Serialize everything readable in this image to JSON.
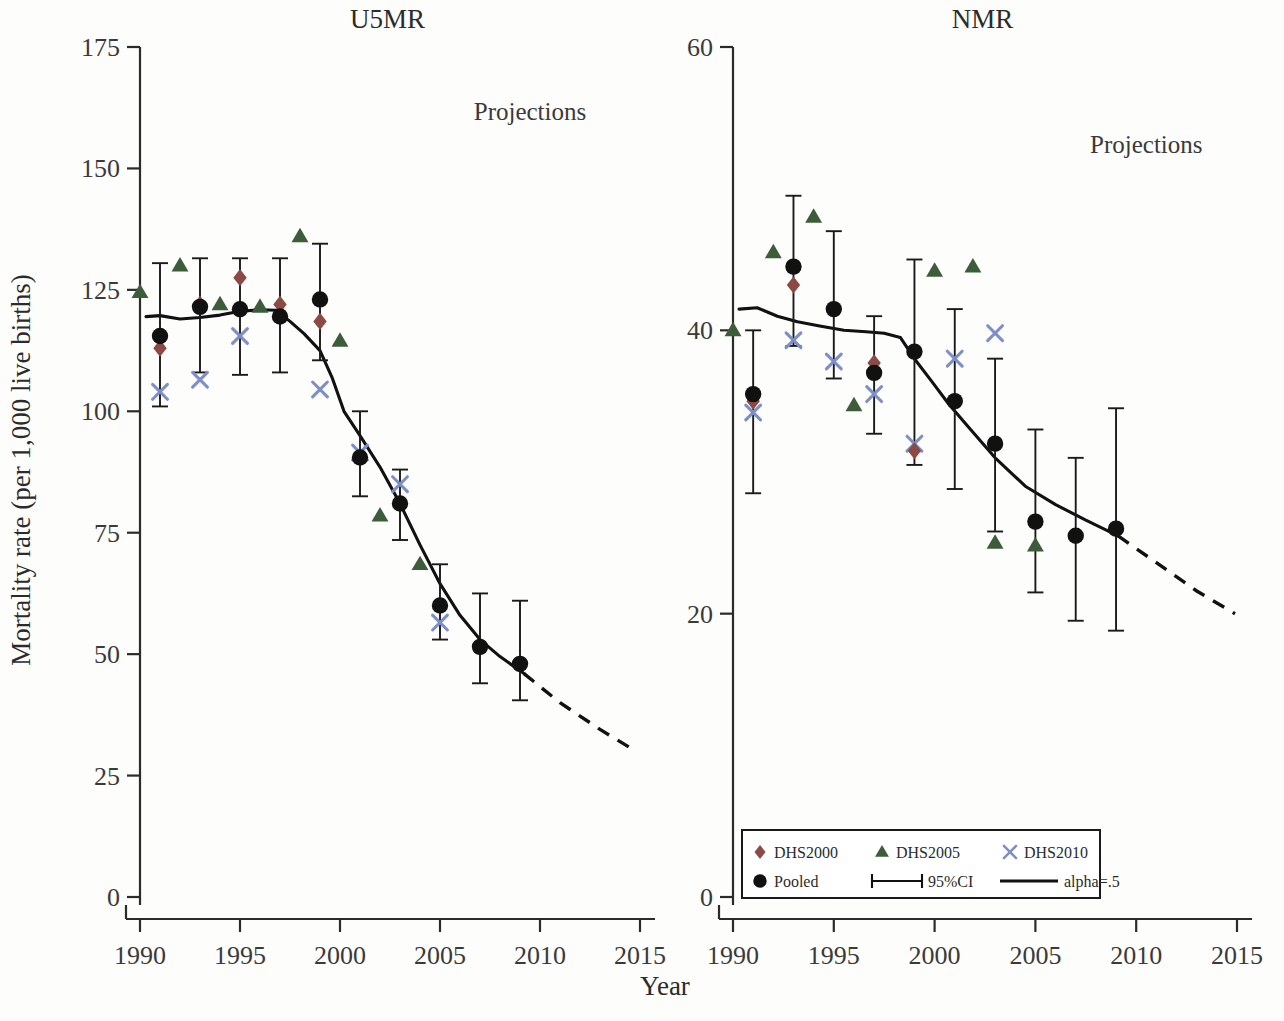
{
  "figure": {
    "x_axis_title": "Year",
    "y_axis_title": "Mortality rate (per 1,000 live births)",
    "projection_label": "Projections"
  },
  "legend": {
    "items": [
      {
        "key": "dhs2000",
        "label": "DHS2000",
        "marker": "diamond",
        "color": "#8c4a44"
      },
      {
        "key": "dhs2005",
        "label": "DHS2005",
        "marker": "triangle",
        "color": "#3c5c3a"
      },
      {
        "key": "dhs2010",
        "label": "DHS2010",
        "marker": "cross",
        "color": "#7d8fc6"
      },
      {
        "key": "pooled",
        "label": "Pooled",
        "marker": "circle",
        "color": "#111111"
      },
      {
        "key": "ci",
        "label": "95%CI",
        "marker": "errorbar",
        "color": "#111111"
      },
      {
        "key": "alpha",
        "label": "alpha=.5",
        "marker": "line",
        "color": "#111111"
      }
    ]
  },
  "chart_data": [
    {
      "type": "scatter",
      "panel": "left",
      "title": "U5MR",
      "xlabel": "Year",
      "ylabel": "Mortality rate (per 1,000 live births)",
      "xlim": [
        1989,
        2016
      ],
      "ylim": [
        0,
        175
      ],
      "xticks": [
        1990,
        1995,
        2000,
        2005,
        2010,
        2015
      ],
      "yticks": [
        0,
        25,
        50,
        75,
        100,
        125,
        150,
        175
      ],
      "grid": false,
      "legend_position": "none",
      "annotations": [
        {
          "text": "Projections",
          "x": 2009.5,
          "y": 160
        }
      ],
      "series": [
        {
          "name": "Pooled",
          "marker": "circle",
          "color": "#111111",
          "points": [
            {
              "x": 1991,
              "y": 115.5,
              "lo": 101.0,
              "hi": 130.5
            },
            {
              "x": 1993,
              "y": 121.5,
              "lo": 108.0,
              "hi": 131.5
            },
            {
              "x": 1995,
              "y": 121.0,
              "lo": 107.5,
              "hi": 131.5
            },
            {
              "x": 1997,
              "y": 119.5,
              "lo": 108.0,
              "hi": 131.5
            },
            {
              "x": 1999,
              "y": 123.0,
              "lo": 110.5,
              "hi": 134.5
            },
            {
              "x": 2001,
              "y": 90.5,
              "lo": 82.5,
              "hi": 100.0
            },
            {
              "x": 2003,
              "y": 81.0,
              "lo": 73.5,
              "hi": 88.0
            },
            {
              "x": 2005,
              "y": 60.0,
              "lo": 53.0,
              "hi": 68.5
            },
            {
              "x": 2007,
              "y": 51.5,
              "lo": 44.0,
              "hi": 62.5
            },
            {
              "x": 2009,
              "y": 48.0,
              "lo": 40.5,
              "hi": 61.0
            }
          ]
        },
        {
          "name": "DHS2000",
          "marker": "diamond",
          "color": "#8c4a44",
          "points": [
            {
              "x": 1991,
              "y": 113.0
            },
            {
              "x": 1993,
              "y": 122.0
            },
            {
              "x": 1995,
              "y": 127.5
            },
            {
              "x": 1997,
              "y": 122.0
            },
            {
              "x": 1999,
              "y": 118.5
            }
          ]
        },
        {
          "name": "DHS2005",
          "marker": "triangle",
          "color": "#3c5c3a",
          "points": [
            {
              "x": 1990,
              "y": 124.5
            },
            {
              "x": 1992,
              "y": 130.0
            },
            {
              "x": 1994,
              "y": 122.0
            },
            {
              "x": 1996,
              "y": 121.5
            },
            {
              "x": 1998,
              "y": 136.0
            },
            {
              "x": 2000,
              "y": 114.5
            },
            {
              "x": 2002,
              "y": 78.5
            },
            {
              "x": 2004,
              "y": 68.5
            }
          ]
        },
        {
          "name": "DHS2010",
          "marker": "cross",
          "color": "#7d8fc6",
          "points": [
            {
              "x": 1991,
              "y": 104.0
            },
            {
              "x": 1993,
              "y": 106.5
            },
            {
              "x": 1995,
              "y": 115.5
            },
            {
              "x": 1999,
              "y": 104.5
            },
            {
              "x": 2001,
              "y": 91.5
            },
            {
              "x": 2003,
              "y": 85.0
            },
            {
              "x": 2005,
              "y": 56.5
            }
          ]
        }
      ],
      "fit_line": {
        "name": "alpha=.5",
        "color": "#111111",
        "solid": [
          {
            "x": 1990.3,
            "y": 119.5
          },
          {
            "x": 1991.0,
            "y": 119.7
          },
          {
            "x": 1992.0,
            "y": 119.0
          },
          {
            "x": 1993.0,
            "y": 119.3
          },
          {
            "x": 1994.0,
            "y": 119.8
          },
          {
            "x": 1995.0,
            "y": 120.6
          },
          {
            "x": 1996.0,
            "y": 120.9
          },
          {
            "x": 1996.8,
            "y": 120.8
          },
          {
            "x": 1997.5,
            "y": 118.5
          },
          {
            "x": 1998.2,
            "y": 116.0
          },
          {
            "x": 1999.0,
            "y": 112.5
          },
          {
            "x": 1999.6,
            "y": 107.0
          },
          {
            "x": 2000.2,
            "y": 100.0
          },
          {
            "x": 2001.0,
            "y": 95.0
          },
          {
            "x": 2002.0,
            "y": 88.5
          },
          {
            "x": 2003.0,
            "y": 81.0
          },
          {
            "x": 2004.0,
            "y": 72.5
          },
          {
            "x": 2005.0,
            "y": 64.5
          },
          {
            "x": 2006.0,
            "y": 58.0
          },
          {
            "x": 2007.0,
            "y": 53.0
          },
          {
            "x": 2008.0,
            "y": 49.5
          },
          {
            "x": 2009.2,
            "y": 46.0
          }
        ],
        "dashed": [
          {
            "x": 2009.2,
            "y": 46.0
          },
          {
            "x": 2011.0,
            "y": 40.0
          },
          {
            "x": 2013.0,
            "y": 34.5
          },
          {
            "x": 2014.6,
            "y": 30.5
          }
        ]
      }
    },
    {
      "type": "scatter",
      "panel": "right",
      "title": "NMR",
      "xlabel": "Year",
      "ylabel": "Mortality rate (per 1,000 live births)",
      "xlim": [
        1989,
        2016
      ],
      "ylim": [
        0,
        60
      ],
      "xticks": [
        1990,
        1995,
        2000,
        2005,
        2010,
        2015
      ],
      "yticks": [
        0,
        20,
        40,
        60
      ],
      "grid": false,
      "legend_position": "bottom-left",
      "annotations": [
        {
          "text": "Projections",
          "x": 2010.5,
          "y": 52.5
        }
      ],
      "series": [
        {
          "name": "Pooled",
          "marker": "circle",
          "color": "#111111",
          "points": [
            {
              "x": 1991,
              "y": 35.5,
              "lo": 28.5,
              "hi": 40.0
            },
            {
              "x": 1993,
              "y": 44.5,
              "lo": 38.9,
              "hi": 49.5
            },
            {
              "x": 1995,
              "y": 41.5,
              "lo": 36.6,
              "hi": 47.0
            },
            {
              "x": 1997,
              "y": 37.0,
              "lo": 32.7,
              "hi": 41.0
            },
            {
              "x": 1999,
              "y": 38.5,
              "lo": 30.5,
              "hi": 45.0
            },
            {
              "x": 2001,
              "y": 35.0,
              "lo": 28.8,
              "hi": 41.5
            },
            {
              "x": 2003,
              "y": 32.0,
              "lo": 25.8,
              "hi": 38.0
            },
            {
              "x": 2005,
              "y": 26.5,
              "lo": 21.5,
              "hi": 33.0
            },
            {
              "x": 2007,
              "y": 25.5,
              "lo": 19.5,
              "hi": 31.0
            },
            {
              "x": 2009,
              "y": 26.0,
              "lo": 18.8,
              "hi": 34.5
            }
          ]
        },
        {
          "name": "DHS2000",
          "marker": "diamond",
          "color": "#8c4a44",
          "points": [
            {
              "x": 1991,
              "y": 35.0
            },
            {
              "x": 1993,
              "y": 43.2
            },
            {
              "x": 1997,
              "y": 37.7
            },
            {
              "x": 1999,
              "y": 31.5
            }
          ]
        },
        {
          "name": "DHS2005",
          "marker": "triangle",
          "color": "#3c5c3a",
          "points": [
            {
              "x": 1990,
              "y": 40.0
            },
            {
              "x": 1992,
              "y": 45.5
            },
            {
              "x": 1994,
              "y": 48.0
            },
            {
              "x": 1996,
              "y": 34.7
            },
            {
              "x": 2000,
              "y": 44.2
            },
            {
              "x": 2001.9,
              "y": 44.5
            },
            {
              "x": 2003,
              "y": 25.0
            },
            {
              "x": 2005,
              "y": 24.8
            }
          ]
        },
        {
          "name": "DHS2010",
          "marker": "cross",
          "color": "#7d8fc6",
          "points": [
            {
              "x": 1991,
              "y": 34.2
            },
            {
              "x": 1993,
              "y": 39.3
            },
            {
              "x": 1995,
              "y": 37.8
            },
            {
              "x": 1997,
              "y": 35.5
            },
            {
              "x": 1999,
              "y": 32.0
            },
            {
              "x": 2001,
              "y": 38.0
            },
            {
              "x": 2003,
              "y": 39.8
            }
          ]
        }
      ],
      "fit_line": {
        "name": "alpha=.5",
        "color": "#111111",
        "solid": [
          {
            "x": 1990.3,
            "y": 41.5
          },
          {
            "x": 1991.2,
            "y": 41.6
          },
          {
            "x": 1992.2,
            "y": 41.0
          },
          {
            "x": 1993.2,
            "y": 40.6
          },
          {
            "x": 1994.3,
            "y": 40.3
          },
          {
            "x": 1995.5,
            "y": 40.0
          },
          {
            "x": 1996.6,
            "y": 39.9
          },
          {
            "x": 1997.5,
            "y": 39.8
          },
          {
            "x": 1998.3,
            "y": 39.5
          },
          {
            "x": 1999.0,
            "y": 38.0
          },
          {
            "x": 1999.8,
            "y": 36.5
          },
          {
            "x": 2000.7,
            "y": 34.8
          },
          {
            "x": 2001.6,
            "y": 33.3
          },
          {
            "x": 2003.0,
            "y": 31.0
          },
          {
            "x": 2004.5,
            "y": 29.0
          },
          {
            "x": 2006.0,
            "y": 27.7
          },
          {
            "x": 2007.5,
            "y": 26.6
          },
          {
            "x": 2009.1,
            "y": 25.5
          }
        ],
        "dashed": [
          {
            "x": 2009.1,
            "y": 25.5
          },
          {
            "x": 2011.0,
            "y": 23.6
          },
          {
            "x": 2013.0,
            "y": 21.6
          },
          {
            "x": 2014.9,
            "y": 20.0
          }
        ]
      }
    }
  ]
}
